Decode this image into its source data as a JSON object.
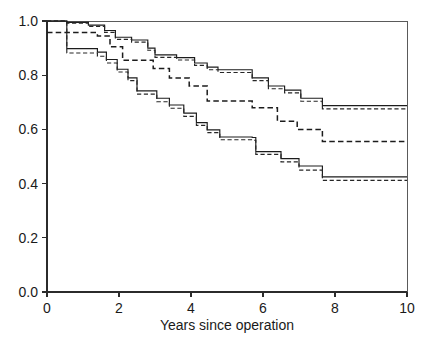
{
  "chart_data": {
    "type": "line",
    "title": "",
    "subtitle": "",
    "xlabel": "Years since operation",
    "ylabel": "",
    "xlim": [
      0,
      10
    ],
    "ylim": [
      0.0,
      1.0
    ],
    "xticks": [
      "0",
      "2",
      "4",
      "6",
      "8",
      "10"
    ],
    "xtick_values": [
      0,
      2,
      4,
      6,
      8,
      10
    ],
    "yticks": [
      "0.0",
      "0.2",
      "0.4",
      "0.6",
      "0.8",
      "1.0"
    ],
    "ytick_values": [
      0.0,
      0.2,
      0.4,
      0.6,
      0.8,
      1.0
    ],
    "grid": false,
    "legend": "none",
    "style": "kaplan-meier-step-survival",
    "annotations": [],
    "series": [
      {
        "name": "group-1-estimate",
        "linestyle": "solid",
        "color": "#1c1c1c",
        "points": [
          [
            0.0,
            1.0
          ],
          [
            0.55,
            1.0
          ],
          [
            0.55,
            0.995
          ],
          [
            1.15,
            0.995
          ],
          [
            1.15,
            0.985
          ],
          [
            1.6,
            0.985
          ],
          [
            1.6,
            0.965
          ],
          [
            1.9,
            0.965
          ],
          [
            1.9,
            0.94
          ],
          [
            2.35,
            0.94
          ],
          [
            2.35,
            0.93
          ],
          [
            2.8,
            0.93
          ],
          [
            2.8,
            0.9
          ],
          [
            3.0,
            0.9
          ],
          [
            3.0,
            0.875
          ],
          [
            3.6,
            0.875
          ],
          [
            3.6,
            0.865
          ],
          [
            4.1,
            0.865
          ],
          [
            4.1,
            0.845
          ],
          [
            4.45,
            0.845
          ],
          [
            4.45,
            0.83
          ],
          [
            4.75,
            0.83
          ],
          [
            4.75,
            0.82
          ],
          [
            5.7,
            0.82
          ],
          [
            5.7,
            0.79
          ],
          [
            6.15,
            0.79
          ],
          [
            6.15,
            0.76
          ],
          [
            6.6,
            0.76
          ],
          [
            6.6,
            0.745
          ],
          [
            7.05,
            0.745
          ],
          [
            7.05,
            0.715
          ],
          [
            7.65,
            0.715
          ],
          [
            7.65,
            0.688
          ],
          [
            10.0,
            0.688
          ]
        ]
      },
      {
        "name": "group-1-confidence-band",
        "linestyle": "dashed",
        "color": "#262626",
        "points": [
          [
            0.0,
            1.0
          ],
          [
            0.55,
            1.0
          ],
          [
            0.55,
            0.992
          ],
          [
            1.15,
            0.992
          ],
          [
            1.15,
            0.98
          ],
          [
            1.6,
            0.98
          ],
          [
            1.6,
            0.958
          ],
          [
            1.9,
            0.958
          ],
          [
            1.9,
            0.932
          ],
          [
            2.35,
            0.932
          ],
          [
            2.35,
            0.922
          ],
          [
            2.8,
            0.922
          ],
          [
            2.8,
            0.892
          ],
          [
            3.0,
            0.892
          ],
          [
            3.0,
            0.866
          ],
          [
            3.6,
            0.866
          ],
          [
            3.6,
            0.856
          ],
          [
            4.1,
            0.856
          ],
          [
            4.1,
            0.836
          ],
          [
            4.45,
            0.836
          ],
          [
            4.45,
            0.82
          ],
          [
            4.75,
            0.82
          ],
          [
            4.75,
            0.81
          ],
          [
            5.7,
            0.81
          ],
          [
            5.7,
            0.78
          ],
          [
            6.15,
            0.78
          ],
          [
            6.15,
            0.75
          ],
          [
            6.6,
            0.75
          ],
          [
            6.6,
            0.735
          ],
          [
            7.05,
            0.735
          ],
          [
            7.05,
            0.704
          ],
          [
            7.65,
            0.704
          ],
          [
            7.65,
            0.676
          ],
          [
            10.0,
            0.676
          ]
        ]
      },
      {
        "name": "group-2-estimate",
        "linestyle": "dashed-wide",
        "color": "#1c1c1c",
        "points": [
          [
            0.0,
            0.958
          ],
          [
            1.4,
            0.958
          ],
          [
            1.4,
            0.945
          ],
          [
            1.75,
            0.945
          ],
          [
            1.75,
            0.905
          ],
          [
            2.1,
            0.905
          ],
          [
            2.1,
            0.855
          ],
          [
            2.95,
            0.855
          ],
          [
            2.95,
            0.825
          ],
          [
            3.4,
            0.825
          ],
          [
            3.4,
            0.79
          ],
          [
            3.95,
            0.79
          ],
          [
            3.95,
            0.76
          ],
          [
            4.45,
            0.76
          ],
          [
            4.45,
            0.705
          ],
          [
            5.7,
            0.705
          ],
          [
            5.7,
            0.68
          ],
          [
            6.4,
            0.68
          ],
          [
            6.4,
            0.63
          ],
          [
            6.95,
            0.63
          ],
          [
            6.95,
            0.6
          ],
          [
            7.65,
            0.6
          ],
          [
            7.65,
            0.555
          ],
          [
            10.0,
            0.555
          ]
        ]
      },
      {
        "name": "group-3-estimate",
        "linestyle": "solid",
        "color": "#1c1c1c",
        "points": [
          [
            0.0,
            1.0
          ],
          [
            0.55,
            1.0
          ],
          [
            0.55,
            0.898
          ],
          [
            1.4,
            0.898
          ],
          [
            1.4,
            0.885
          ],
          [
            1.65,
            0.885
          ],
          [
            1.65,
            0.858
          ],
          [
            1.95,
            0.858
          ],
          [
            1.95,
            0.822
          ],
          [
            2.25,
            0.822
          ],
          [
            2.25,
            0.79
          ],
          [
            2.5,
            0.79
          ],
          [
            2.5,
            0.742
          ],
          [
            3.05,
            0.742
          ],
          [
            3.05,
            0.715
          ],
          [
            3.4,
            0.715
          ],
          [
            3.4,
            0.69
          ],
          [
            3.8,
            0.69
          ],
          [
            3.8,
            0.66
          ],
          [
            4.15,
            0.66
          ],
          [
            4.15,
            0.625
          ],
          [
            4.45,
            0.625
          ],
          [
            4.45,
            0.598
          ],
          [
            4.8,
            0.598
          ],
          [
            4.8,
            0.572
          ],
          [
            5.7,
            0.572
          ],
          [
            5.7,
            0.57
          ],
          [
            5.8,
            0.57
          ],
          [
            5.8,
            0.518
          ],
          [
            6.5,
            0.518
          ],
          [
            6.5,
            0.492
          ],
          [
            7.0,
            0.492
          ],
          [
            7.0,
            0.465
          ],
          [
            7.65,
            0.465
          ],
          [
            7.65,
            0.425
          ],
          [
            10.0,
            0.425
          ]
        ]
      },
      {
        "name": "group-3-confidence-band",
        "linestyle": "dashed",
        "color": "#262626",
        "points": [
          [
            0.0,
            1.0
          ],
          [
            0.55,
            1.0
          ],
          [
            0.55,
            0.882
          ],
          [
            1.4,
            0.882
          ],
          [
            1.4,
            0.87
          ],
          [
            1.65,
            0.87
          ],
          [
            1.65,
            0.845
          ],
          [
            1.95,
            0.845
          ],
          [
            1.95,
            0.812
          ],
          [
            2.25,
            0.812
          ],
          [
            2.25,
            0.78
          ],
          [
            2.5,
            0.78
          ],
          [
            2.5,
            0.73
          ],
          [
            3.05,
            0.73
          ],
          [
            3.05,
            0.702
          ],
          [
            3.4,
            0.702
          ],
          [
            3.4,
            0.678
          ],
          [
            3.8,
            0.678
          ],
          [
            3.8,
            0.648
          ],
          [
            4.15,
            0.648
          ],
          [
            4.15,
            0.615
          ],
          [
            4.45,
            0.615
          ],
          [
            4.45,
            0.588
          ],
          [
            4.8,
            0.588
          ],
          [
            4.8,
            0.562
          ],
          [
            5.7,
            0.562
          ],
          [
            5.7,
            0.56
          ],
          [
            5.8,
            0.56
          ],
          [
            5.8,
            0.508
          ],
          [
            6.5,
            0.508
          ],
          [
            6.5,
            0.48
          ],
          [
            7.0,
            0.48
          ],
          [
            7.0,
            0.45
          ],
          [
            7.65,
            0.45
          ],
          [
            7.65,
            0.412
          ],
          [
            10.0,
            0.412
          ]
        ]
      }
    ],
    "group_count": 3,
    "band_style_note": "each estimate is shadowed by a dashed confidence/alternate curve"
  },
  "figure": {
    "x_axis_label": "Years since operation",
    "caption_partial": ""
  }
}
